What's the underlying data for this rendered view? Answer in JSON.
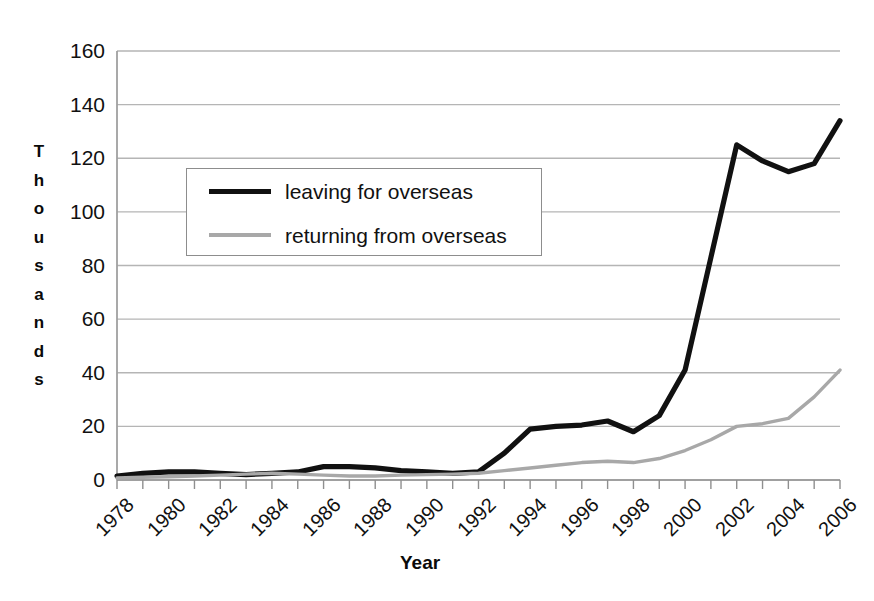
{
  "chart_data": {
    "type": "line",
    "title": "",
    "xlabel": "Year",
    "ylabel": "Thousands",
    "grid": true,
    "legend_position": "inside-upper-left",
    "xlim": [
      1978,
      2006
    ],
    "ylim": [
      0,
      160
    ],
    "y_ticks": [
      0,
      20,
      40,
      60,
      80,
      100,
      120,
      140,
      160
    ],
    "x_tick_labels": [
      "1978",
      "1980",
      "1982",
      "1984",
      "1986",
      "1988",
      "1990",
      "1992",
      "1994",
      "1996",
      "1998",
      "2000",
      "2002",
      "2004",
      "2006"
    ],
    "x_minor_ticks_every": 1,
    "x": [
      1978,
      1979,
      1980,
      1981,
      1982,
      1983,
      1984,
      1985,
      1986,
      1987,
      1988,
      1989,
      1990,
      1991,
      1992,
      1993,
      1994,
      1995,
      1996,
      1997,
      1998,
      1999,
      2000,
      2001,
      2002,
      2003,
      2004,
      2005,
      2006
    ],
    "series": [
      {
        "name": "leaving for overseas",
        "color": "#111111",
        "style": "solid-thick",
        "values": [
          1.5,
          2.5,
          3.0,
          3.0,
          2.5,
          2.0,
          2.5,
          3.0,
          5.0,
          5.0,
          4.5,
          3.5,
          3.0,
          2.5,
          3.0,
          10.0,
          19.0,
          20.0,
          20.5,
          22.0,
          18.0,
          24.0,
          41.0,
          83.0,
          125.0,
          119.0,
          115.0,
          118.0,
          134.0
        ]
      },
      {
        "name": "returning from overseas",
        "color": "#a8a8a8",
        "style": "solid-thin",
        "values": [
          0.8,
          1.0,
          1.2,
          1.5,
          1.8,
          2.2,
          2.5,
          2.2,
          1.8,
          1.5,
          1.5,
          1.8,
          2.0,
          2.2,
          2.5,
          3.5,
          4.5,
          5.5,
          6.5,
          7.0,
          6.5,
          8.0,
          11.0,
          15.0,
          20.0,
          21.0,
          23.0,
          31.0,
          41.0
        ]
      }
    ]
  },
  "legend": {
    "items": [
      {
        "label": "leaving for overseas",
        "swatch": "dark"
      },
      {
        "label": "returning from overseas",
        "swatch": "light"
      }
    ]
  },
  "axes": {
    "y_title_letters": [
      "T",
      "h",
      "o",
      "u",
      "s",
      "a",
      "n",
      "d",
      "s"
    ],
    "x_title": "Year"
  }
}
